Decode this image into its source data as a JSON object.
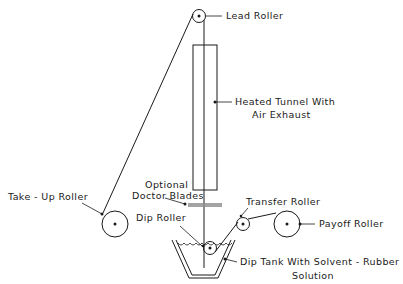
{
  "diagram": {
    "type": "process-schematic",
    "labels": {
      "lead_roller": "Lead  Roller",
      "heated_tunnel_line1": "Heated  Tunnel  With",
      "heated_tunnel_line2": "Air  Exhaust",
      "optional_line1": "Optional",
      "optional_line2": "Doctor  Blades",
      "take_up_roller": "Take - Up Roller",
      "dip_roller": "Dip  Roller",
      "transfer_roller": "Transfer  Roller",
      "payoff_roller": "Payoff  Roller",
      "dip_tank_line1": "Dip  Tank  With  Solvent - Rubber",
      "dip_tank_line2": "Solution"
    },
    "components": [
      {
        "id": "lead-roller",
        "label": "Lead Roller"
      },
      {
        "id": "heated-tunnel",
        "label": "Heated Tunnel With Air Exhaust"
      },
      {
        "id": "doctor-blades",
        "label": "Optional Doctor Blades"
      },
      {
        "id": "take-up-roller",
        "label": "Take-Up Roller"
      },
      {
        "id": "dip-roller",
        "label": "Dip Roller"
      },
      {
        "id": "transfer-roller",
        "label": "Transfer Roller"
      },
      {
        "id": "payoff-roller",
        "label": "Payoff Roller"
      },
      {
        "id": "dip-tank",
        "label": "Dip Tank With Solvent-Rubber Solution"
      }
    ],
    "colors": {
      "line": "#1a1a1a",
      "background": "#ffffff"
    }
  }
}
